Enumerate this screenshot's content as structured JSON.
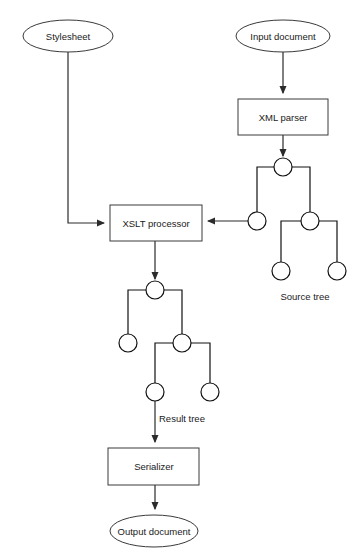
{
  "diagram": {
    "canvas": {
      "width": 361,
      "height": 560,
      "background": "#ffffff"
    },
    "colors": {
      "stroke": "#2b2b2b",
      "box_stroke": "#3a3a3a",
      "node_stroke": "#111111",
      "fill": "#ffffff",
      "text": "#1a1a1a"
    },
    "nodes": {
      "stylesheet": {
        "label": "Stylesheet",
        "shape": "ellipse",
        "cx": 68,
        "cy": 36,
        "rx": 45,
        "ry": 16
      },
      "input_document": {
        "label": "Input document",
        "shape": "ellipse",
        "cx": 283,
        "cy": 36,
        "rx": 47,
        "ry": 16
      },
      "xml_parser": {
        "label": "XML parser",
        "shape": "rect",
        "x": 238,
        "y": 99,
        "w": 90,
        "h": 36
      },
      "xslt_processor": {
        "label": "XSLT processor",
        "shape": "rect",
        "x": 110,
        "y": 205,
        "w": 92,
        "h": 36
      },
      "serializer": {
        "label": "Serializer",
        "shape": "rect",
        "x": 108,
        "y": 448,
        "w": 91,
        "h": 37
      },
      "output_document": {
        "label": "Output document",
        "shape": "ellipse",
        "cx": 154,
        "cy": 531,
        "rx": 44,
        "ry": 16
      }
    },
    "captions": {
      "source_tree": {
        "label": "Source tree",
        "x": 305,
        "y": 297
      },
      "result_tree": {
        "label": "Result tree",
        "x": 158,
        "y": 419
      }
    },
    "source_tree": {
      "caption": "Source tree",
      "node_radius": 9,
      "nodes": [
        {
          "id": "s-root",
          "cx": 283,
          "cy": 167
        },
        {
          "id": "s-left",
          "cx": 257,
          "cy": 221
        },
        {
          "id": "s-right",
          "cx": 310,
          "cy": 221
        },
        {
          "id": "s-right-left",
          "cx": 281,
          "cy": 271
        },
        {
          "id": "s-right-right",
          "cx": 337,
          "cy": 271
        }
      ],
      "edges": [
        {
          "from": "s-root",
          "to": "s-left"
        },
        {
          "from": "s-root",
          "to": "s-right"
        },
        {
          "from": "s-right",
          "to": "s-right-left"
        },
        {
          "from": "s-right",
          "to": "s-right-right"
        }
      ]
    },
    "result_tree": {
      "caption": "Result tree",
      "node_radius": 9,
      "nodes": [
        {
          "id": "r-root",
          "cx": 155,
          "cy": 290
        },
        {
          "id": "r-left",
          "cx": 128,
          "cy": 343
        },
        {
          "id": "r-right",
          "cx": 182,
          "cy": 343
        },
        {
          "id": "r-right-left",
          "cx": 155,
          "cy": 392
        },
        {
          "id": "r-right-right",
          "cx": 210,
          "cy": 392
        }
      ],
      "edges": [
        {
          "from": "r-root",
          "to": "r-left"
        },
        {
          "from": "r-root",
          "to": "r-right"
        },
        {
          "from": "r-right",
          "to": "r-right-left"
        },
        {
          "from": "r-right",
          "to": "r-right-right"
        }
      ]
    },
    "connectors": [
      {
        "id": "stylesheet-to-xslt",
        "from": "stylesheet",
        "to": "xslt_processor",
        "arrow": true
      },
      {
        "id": "input-to-parser",
        "from": "input_document",
        "to": "xml_parser",
        "arrow": true
      },
      {
        "id": "parser-to-source-tree",
        "from": "xml_parser",
        "to": "s-root",
        "arrow": true
      },
      {
        "id": "source-tree-to-xslt",
        "from": "s-left",
        "to": "xslt_processor",
        "arrow": true
      },
      {
        "id": "xslt-to-result-tree",
        "from": "xslt_processor",
        "to": "r-root",
        "arrow": true
      },
      {
        "id": "result-tree-to-serializer",
        "from": "r-right-left",
        "to": "serializer",
        "arrow": true
      },
      {
        "id": "serializer-to-output",
        "from": "serializer",
        "to": "output_document",
        "arrow": true
      }
    ]
  }
}
